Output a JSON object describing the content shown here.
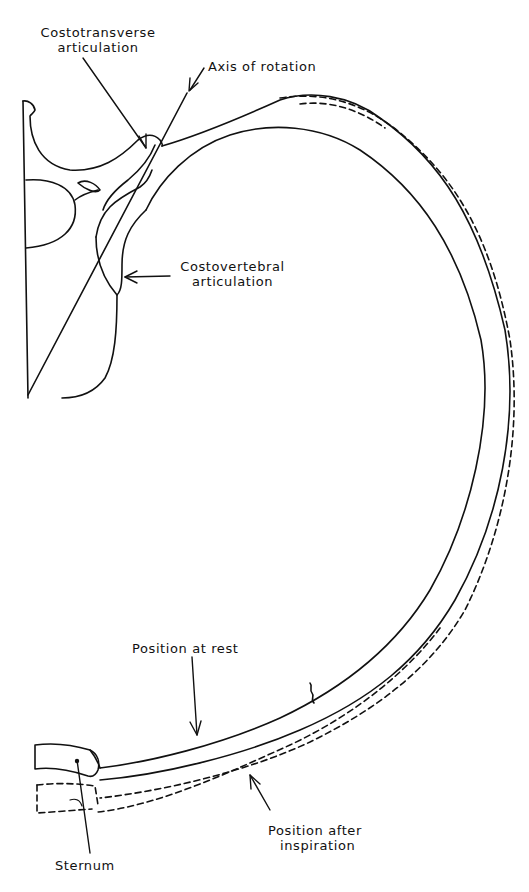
{
  "figure": {
    "colors": {
      "line": "#111111",
      "background": "#ffffff"
    },
    "labels": {
      "costotransverse": {
        "line1": "Costotransverse",
        "line2": "articulation"
      },
      "axis": "Axis of rotation",
      "costovertebral": {
        "line1": "Costovertebral",
        "line2": "articulation"
      },
      "rest": "Position at rest",
      "sternum": "Sternum",
      "inspiration": {
        "line1": "Position after",
        "line2": "inspiration"
      }
    },
    "legend": {
      "solid_line": "Position at rest",
      "dashed_line": "Position after inspiration"
    }
  }
}
